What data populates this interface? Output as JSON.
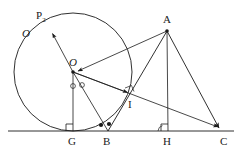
{
  "figure": {
    "kind": "geometry-diagram",
    "background_color": "#ffffff",
    "stroke_color": "#1a1a1a",
    "width": 240,
    "height": 157
  },
  "labels": {
    "circle_name": "O",
    "p2_letter": "P",
    "p2_sub": "2",
    "center_O": "O",
    "vertex_A": "A",
    "point_I": "I",
    "point_G": "G",
    "point_B": "B",
    "point_H": "H",
    "point_C": "C"
  },
  "points": {
    "O": {
      "x": 73,
      "y": 72
    },
    "P2": {
      "x": 49,
      "y": 28
    },
    "A": {
      "x": 167,
      "y": 31
    },
    "I": {
      "x": 131,
      "y": 95
    },
    "G": {
      "x": 73,
      "y": 131
    },
    "B": {
      "x": 108,
      "y": 131
    },
    "H": {
      "x": 168,
      "y": 131
    },
    "C": {
      "x": 222,
      "y": 131
    }
  },
  "circle": {
    "center_x": 73,
    "center_y": 72,
    "radius": 59
  },
  "baseline": {
    "x1": 8,
    "y1": 131,
    "x2": 234,
    "y2": 131
  },
  "segments": [
    {
      "name": "O-to-P2",
      "from": "O",
      "to": "P2",
      "arrow": "end"
    },
    {
      "name": "A-to-O",
      "from": "A",
      "to": "O",
      "arrow": "end"
    },
    {
      "name": "A-to-B",
      "from": "A",
      "to": "B",
      "arrow": "none"
    },
    {
      "name": "A-to-H",
      "from": "A",
      "to": "H",
      "arrow": "none"
    },
    {
      "name": "A-to-C",
      "from": "A",
      "to": "C",
      "arrow": "end"
    },
    {
      "name": "O-to-I",
      "from": "O",
      "to": "I",
      "arrow": "end"
    },
    {
      "name": "O-to-B",
      "from": "O",
      "to": "B",
      "arrow": "none"
    },
    {
      "name": "O-to-G",
      "from": "O",
      "to": "G",
      "arrow": "none"
    },
    {
      "name": "O-to-C",
      "from": "O",
      "to": "C",
      "arrow": "end"
    }
  ],
  "markers": {
    "right_angle_at_G": true,
    "right_angle_at_H": true,
    "right_angle_at_I": true,
    "angle_arc_at_H": true,
    "open_circle_marks_at_O": 2,
    "filled_dot_marks_at_B": 2,
    "filled_dot_at_A": true,
    "filled_dot_at_O": true
  }
}
